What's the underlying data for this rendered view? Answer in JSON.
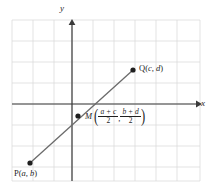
{
  "figure": {
    "type": "coordinate-geometry-diagram",
    "topic": "midpoint-formula",
    "background_color": "#ffffff",
    "grid_color": "#dcdcdc",
    "axis_color": "#3a3a3a",
    "segment_color": "#6b6b6b",
    "point_color": "#1f1f1f",
    "text_color": "#1f1f1f"
  },
  "axes": {
    "x_label": "x",
    "y_label": "y",
    "origin": {
      "x": 72,
      "y": 104
    },
    "x_axis": {
      "start_x": 12,
      "end_x": 198,
      "y": 104
    },
    "y_axis": {
      "x": 72,
      "start_y": 181,
      "end_y": 22
    }
  },
  "grid": {
    "left": 12,
    "top": 20,
    "right": 200,
    "bottom": 181,
    "cell_size": 21,
    "columns": 9,
    "rows": 8
  },
  "points": [
    {
      "id": "P",
      "name": "P",
      "label": "P(a, b)",
      "label_prefix": "P(",
      "label_var1": "a",
      "label_sep": ", ",
      "label_var2": "b",
      "label_suffix": ")",
      "px": 30,
      "py": 163
    },
    {
      "id": "Q",
      "name": "Q",
      "label": "Q(c, d)",
      "label_prefix": "Q(",
      "label_var1": "c",
      "label_sep": ", ",
      "label_var2": "d",
      "label_suffix": ")",
      "px": 133,
      "py": 70
    },
    {
      "id": "M",
      "name": "M",
      "label": "M((a + c)/2, (b + d)/2)",
      "letter": "M",
      "open_paren": "(",
      "close_paren": ")",
      "separator": ",",
      "fraction_x": {
        "numerator": "a + c",
        "denominator": "2"
      },
      "fraction_y": {
        "numerator": "b + d",
        "denominator": "2"
      },
      "px": 78,
      "py": 116
    }
  ],
  "segment": {
    "name": "PQ",
    "from": "P",
    "to": "Q",
    "from_x": 30,
    "from_y": 163,
    "to_x": 133,
    "to_y": 70
  }
}
